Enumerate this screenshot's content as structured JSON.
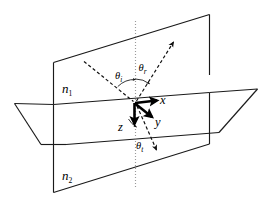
{
  "figure": {
    "type": "optics-ray-diagram",
    "background_color": "#ffffff",
    "line_color": "#1a1a1a",
    "normal_color": "#9a9a9a"
  },
  "media": {
    "upper": {
      "symbol": "n",
      "subscript": "1",
      "full": "n1",
      "position": "upper-left of vertical plane"
    },
    "lower": {
      "symbol": "n",
      "subscript": "2",
      "full": "n2",
      "position": "lower-left of vertical plane"
    }
  },
  "angles": {
    "incident": {
      "symbol": "θ",
      "subscript": "i",
      "full": "θi",
      "description": "angle of incidence"
    },
    "reflected": {
      "symbol": "θ",
      "subscript": "r",
      "full": "θr",
      "description": "angle of reflection"
    },
    "transmitted": {
      "symbol": "θ",
      "subscript": "t",
      "full": "θt",
      "description": "angle of transmission"
    }
  },
  "axes": {
    "x": {
      "label": "x",
      "direction": "right, in plane of interface"
    },
    "y": {
      "label": "y",
      "direction": "down-right, into interface plane"
    },
    "z": {
      "label": "z",
      "direction": "straight down, along normal"
    }
  },
  "rays": {
    "incident": {
      "style": "dashed",
      "from": "upper-left",
      "to": "origin"
    },
    "reflected": {
      "style": "dashed",
      "from": "origin",
      "to": "upper-right",
      "arrowhead": true
    },
    "transmitted": {
      "style": "dashed",
      "from": "origin",
      "to": "lower-right",
      "arrowhead": true
    },
    "normal": {
      "style": "dotted",
      "orientation": "vertical",
      "color": "#9a9a9a"
    }
  },
  "surfaces": {
    "vertical_plane": {
      "description": "plane of incidence, drawn as a parallelogram standing upright"
    },
    "horizontal_plane": {
      "description": "interface plane between media n1 and n2, drawn in perspective"
    }
  }
}
